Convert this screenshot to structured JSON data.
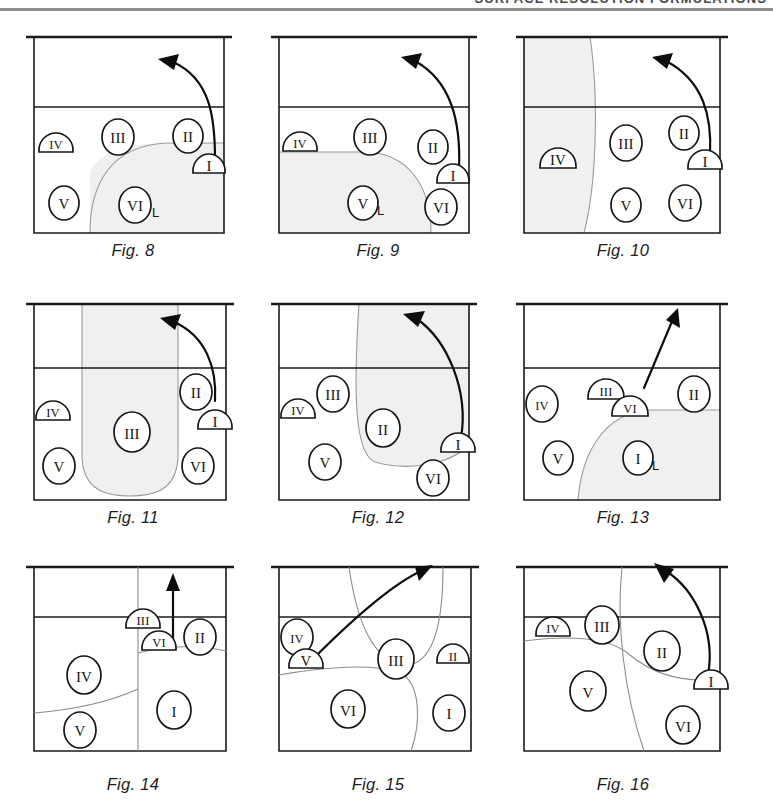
{
  "header": {
    "running_title": "SURFACE RESOLUTION FORMULATIONS"
  },
  "figures": [
    {
      "id": "fig-8",
      "caption": "Fig. 8",
      "row": 0,
      "col": 0,
      "markers": [
        {
          "label": "IV",
          "shape": "dome",
          "x": 42,
          "y": 118
        },
        {
          "label": "III",
          "shape": "circle",
          "x": 110,
          "y": 108
        },
        {
          "label": "II",
          "shape": "circle",
          "x": 175,
          "y": 108
        },
        {
          "label": "I",
          "shape": "dome",
          "x": 198,
          "y": 138
        },
        {
          "label": "V",
          "shape": "circle",
          "x": 58,
          "y": 172
        },
        {
          "label": "VI",
          "shape": "circle",
          "x": 128,
          "y": 180,
          "sub": "L"
        }
      ],
      "shade_kind": "lower-right-lobe",
      "arrow_kind": "curved-left"
    },
    {
      "id": "fig-9",
      "caption": "Fig. 9",
      "row": 0,
      "col": 1,
      "markers": [
        {
          "label": "IV",
          "shape": "dome",
          "x": 42,
          "y": 118
        },
        {
          "label": "III",
          "shape": "circle",
          "x": 115,
          "y": 108
        },
        {
          "label": "II",
          "shape": "circle",
          "x": 180,
          "y": 118
        },
        {
          "label": "I",
          "shape": "dome",
          "x": 197,
          "y": 146
        },
        {
          "label": "V",
          "shape": "circle",
          "x": 110,
          "y": 180,
          "sub": "L"
        },
        {
          "label": "VI",
          "shape": "circle",
          "x": 185,
          "y": 180
        }
      ],
      "shade_kind": "lower-left-lobe",
      "arrow_kind": "curved-left"
    },
    {
      "id": "fig-10",
      "caption": "Fig. 10",
      "row": 0,
      "col": 2,
      "markers": [
        {
          "label": "IV",
          "shape": "dome",
          "x": 48,
          "y": 148
        },
        {
          "label": "III",
          "shape": "circle",
          "x": 122,
          "y": 118
        },
        {
          "label": "II",
          "shape": "circle",
          "x": 180,
          "y": 108
        },
        {
          "label": "I",
          "shape": "dome",
          "x": 198,
          "y": 138
        },
        {
          "label": "V",
          "shape": "circle",
          "x": 122,
          "y": 180
        },
        {
          "label": "VI",
          "shape": "circle",
          "x": 182,
          "y": 180
        }
      ],
      "shade_kind": "left-column",
      "arrow_kind": "curved-left"
    },
    {
      "id": "fig-11",
      "caption": "Fig. 11",
      "row": 1,
      "col": 0,
      "markers": [
        {
          "label": "IV",
          "shape": "dome",
          "x": 42,
          "y": 122
        },
        {
          "label": "III",
          "shape": "circle",
          "x": 120,
          "y": 143
        },
        {
          "label": "II",
          "shape": "circle",
          "x": 182,
          "y": 100
        },
        {
          "label": "I",
          "shape": "dome",
          "x": 197,
          "y": 130
        },
        {
          "label": "V",
          "shape": "circle",
          "x": 52,
          "y": 170
        },
        {
          "label": "VI",
          "shape": "circle",
          "x": 185,
          "y": 172
        }
      ],
      "shade_kind": "center-u",
      "arrow_kind": "curved-left"
    },
    {
      "id": "fig-12",
      "caption": "Fig. 12",
      "row": 1,
      "col": 1,
      "markers": [
        {
          "label": "III",
          "shape": "circle",
          "x": 78,
          "y": 100
        },
        {
          "label": "IV",
          "shape": "dome",
          "x": 40,
          "y": 122
        },
        {
          "label": "II",
          "shape": "circle",
          "x": 128,
          "y": 142
        },
        {
          "label": "I",
          "shape": "dome",
          "x": 196,
          "y": 158
        },
        {
          "label": "V",
          "shape": "circle",
          "x": 70,
          "y": 170
        },
        {
          "label": "VI",
          "shape": "circle",
          "x": 178,
          "y": 184
        }
      ],
      "shade_kind": "right-lobe",
      "arrow_kind": "curved-left-long"
    },
    {
      "id": "fig-13",
      "caption": "Fig. 13",
      "row": 1,
      "col": 2,
      "markers": [
        {
          "label": "III",
          "shape": "dome",
          "x": 106,
          "y": 102
        },
        {
          "label": "VI",
          "shape": "dome",
          "x": 128,
          "y": 116
        },
        {
          "label": "IV",
          "shape": "circle",
          "x": 40,
          "y": 120
        },
        {
          "label": "II",
          "shape": "circle",
          "x": 192,
          "y": 108
        },
        {
          "label": "V",
          "shape": "circle",
          "x": 58,
          "y": 172
        },
        {
          "label": "I",
          "shape": "circle",
          "x": 138,
          "y": 170,
          "sub": "L"
        }
      ],
      "shade_kind": "lower-right-round",
      "arrow_kind": "straight-up-right"
    },
    {
      "id": "fig-14",
      "caption": "Fig. 14",
      "row": 2,
      "col": 0,
      "markers": [
        {
          "label": "III",
          "shape": "dome",
          "x": 133,
          "y": 63
        },
        {
          "label": "VI",
          "shape": "dome",
          "x": 148,
          "y": 88
        },
        {
          "label": "II",
          "shape": "circle",
          "x": 208,
          "y": 78
        },
        {
          "label": "IV",
          "shape": "circle",
          "x": 74,
          "y": 118
        },
        {
          "label": "I",
          "shape": "circle",
          "x": 160,
          "y": 156
        },
        {
          "label": "V",
          "shape": "circle",
          "x": 70,
          "y": 178
        }
      ],
      "shade_kind": "none",
      "arrow_kind": "straight-up"
    },
    {
      "id": "fig-15",
      "caption": "Fig. 15",
      "row": 2,
      "col": 1,
      "markers": [
        {
          "label": "IV",
          "shape": "circle",
          "x": 43,
          "y": 78
        },
        {
          "label": "V",
          "shape": "dome",
          "x": 52,
          "y": 102
        },
        {
          "label": "III",
          "shape": "circle",
          "x": 140,
          "y": 98
        },
        {
          "label": "II",
          "shape": "dome",
          "x": 196,
          "y": 96
        },
        {
          "label": "VI",
          "shape": "circle",
          "x": 92,
          "y": 152
        },
        {
          "label": "I",
          "shape": "circle",
          "x": 196,
          "y": 156
        }
      ],
      "shade_kind": "none",
      "arrow_kind": "curved-upleft"
    },
    {
      "id": "fig-16",
      "caption": "Fig. 16",
      "row": 2,
      "col": 2,
      "markers": [
        {
          "label": "IV",
          "shape": "dome",
          "x": 55,
          "y": 70
        },
        {
          "label": "III",
          "shape": "circle",
          "x": 100,
          "y": 70
        },
        {
          "label": "II",
          "shape": "circle",
          "x": 162,
          "y": 94
        },
        {
          "label": "I",
          "shape": "dome",
          "x": 210,
          "y": 126
        },
        {
          "label": "V",
          "shape": "circle",
          "x": 88,
          "y": 130
        },
        {
          "label": "VI",
          "shape": "circle",
          "x": 182,
          "y": 166
        }
      ],
      "shade_kind": "none",
      "arrow_kind": "curved-left"
    }
  ],
  "colors": {
    "ink": "#161616",
    "shade": "#f0f0f0",
    "soft_line": "#8d8d8d",
    "header_rule": "#8e8e8e"
  }
}
